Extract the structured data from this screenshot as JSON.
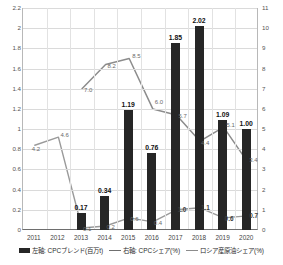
{
  "chart_data": {
    "type": "bar",
    "title": "",
    "subtitle": "",
    "xlabel": "",
    "ylabel": "",
    "categories": [
      "2011",
      "2012",
      "2013",
      "2014",
      "2015",
      "2016",
      "2017",
      "2018",
      "2019",
      "2020"
    ],
    "grid": true,
    "legend_position": "bottom",
    "axes": {
      "left": {
        "label": "",
        "min": 0,
        "max": 2.2,
        "step": 0.2,
        "ticks": [
          "0",
          "0.2",
          "0.4",
          "0.6",
          "0.8",
          "1",
          "1.2",
          "1.4",
          "1.6",
          "1.8",
          "2",
          "2.2"
        ]
      },
      "right": {
        "label": "",
        "min": 0,
        "max": 11,
        "step": 1,
        "ticks": [
          "0",
          "1",
          "2",
          "3",
          "4",
          "5",
          "6",
          "7",
          "8",
          "9",
          "10",
          "11"
        ]
      }
    },
    "series": [
      {
        "name": "左軸: CPCブレンド(百万t)",
        "type": "bar",
        "axis": "left",
        "color": "#262626",
        "values": [
          null,
          null,
          0.17,
          0.34,
          1.19,
          0.76,
          1.85,
          2.02,
          1.09,
          1.0
        ],
        "labels": [
          "",
          "",
          "0.17",
          "0.34",
          "1.19",
          "0.76",
          "1.85",
          "2.02",
          "1.09",
          "1.00"
        ]
      },
      {
        "name": "右軸: CPCシェア(%)",
        "type": "line",
        "axis": "right",
        "color": "#8c8c8c",
        "values": [
          null,
          null,
          7.0,
          8.2,
          8.5,
          6.0,
          5.7,
          4.4,
          5.1,
          3.4
        ],
        "labels": [
          "",
          "",
          "7.0",
          "8.2",
          "8.5",
          "6.0",
          "5.7",
          "4.4",
          "5.1",
          "3.4"
        ]
      },
      {
        "name": "ロシア産原油シェア(%)",
        "type": "line",
        "axis": "right",
        "color": "#9a9a9a",
        "values": [
          4.2,
          4.6,
          0.1,
          0.2,
          0.6,
          0.4,
          1.0,
          1.1,
          0.6,
          0.7
        ],
        "labels": [
          "4.2",
          "4.6",
          "0.1",
          "0.2",
          "0.6",
          "0.4",
          "1.0",
          "1.1",
          "0.6",
          "0.7"
        ]
      }
    ]
  },
  "legend": {
    "items": [
      {
        "label": "左軸: CPCブレンド(百万t)",
        "marker": "bar-swatch"
      },
      {
        "label": "右軸: CPCシェア(%)",
        "marker": "line-swatch"
      },
      {
        "label": "ロシア産原油シェア(%)",
        "marker": "line-swatch"
      }
    ]
  }
}
